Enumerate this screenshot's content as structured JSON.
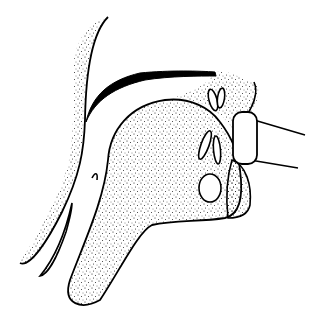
{
  "figure": {
    "colors": {
      "line": "#000000",
      "background": "#ffffff",
      "stipple": "#1a1a1a"
    }
  }
}
